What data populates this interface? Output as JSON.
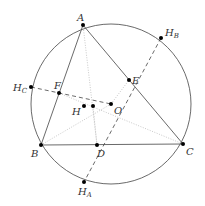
{
  "diagram": {
    "colors": {
      "stroke": "#444444",
      "dotted": "#bbbbbb",
      "point": "#000000",
      "label": "#333333"
    },
    "circle": {
      "cx": 111,
      "cy": 104,
      "r": 80
    },
    "points": {
      "A": {
        "x": 83,
        "y": 25,
        "label": "A"
      },
      "B": {
        "x": 41,
        "y": 145,
        "label": "B"
      },
      "C": {
        "x": 183,
        "y": 144,
        "label": "C"
      },
      "D": {
        "x": 97,
        "y": 145,
        "label": "D"
      },
      "E": {
        "x": 129,
        "y": 80,
        "label": "E"
      },
      "F": {
        "x": 59,
        "y": 93,
        "label": "F"
      },
      "H": {
        "x": 84,
        "y": 106,
        "label": "H"
      },
      "H2": {
        "x": 93,
        "y": 106
      },
      "O": {
        "x": 111,
        "y": 104,
        "label": "O"
      },
      "HA": {
        "x": 84,
        "y": 182,
        "label": "H",
        "sub": "A"
      },
      "HB": {
        "x": 161,
        "y": 38,
        "label": "H",
        "sub": "B"
      },
      "HC": {
        "x": 31,
        "y": 87,
        "label": "H",
        "sub": "C"
      }
    },
    "labels": {
      "A": "A",
      "B": "B",
      "C": "C",
      "D": "D",
      "E": "E",
      "F": "F",
      "H": "H",
      "O": "O",
      "HA_main": "H",
      "HA_sub": "A",
      "HB_main": "H",
      "HB_sub": "B",
      "HC_main": "H",
      "HC_sub": "C"
    }
  }
}
